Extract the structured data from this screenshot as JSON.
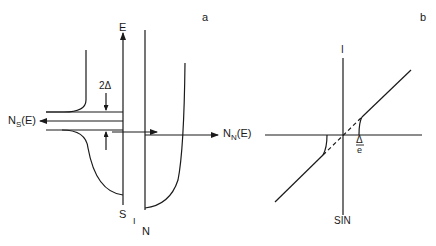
{
  "panel_a": {
    "label": "a",
    "energy_axis": "E",
    "ns_label_main": "N",
    "ns_label_sub": "S",
    "ns_label_tail": "(E)",
    "nn_label_main": "N",
    "nn_label_sub": "N",
    "nn_label_tail": "(E)",
    "gap_label": "2Δ",
    "s_label": "S",
    "i_label": "I",
    "n_label": "N"
  },
  "panel_b": {
    "label": "b",
    "current_axis": "I",
    "gap_num": "Δ",
    "gap_den": "e",
    "junction_label": "SIN"
  },
  "colors": {
    "ink": "#1a1a1a",
    "background": "#ffffff"
  }
}
